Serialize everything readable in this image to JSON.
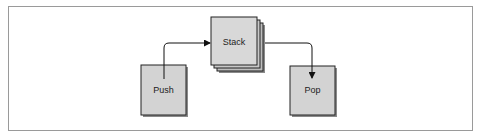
{
  "diagram": {
    "colors": {
      "box_fill": "#d3d3d3",
      "box_stroke": "#222222",
      "shadow": "#8a8a8a",
      "stack_back_fill": "#bdbdbd",
      "connector": "#111111",
      "frame_border": "#9a9a9a"
    },
    "nodes": [
      {
        "id": "push",
        "label": "Push"
      },
      {
        "id": "stack",
        "label": "Stack"
      },
      {
        "id": "pop",
        "label": "Pop"
      }
    ],
    "edges": [
      {
        "from": "push",
        "to": "stack"
      },
      {
        "from": "stack",
        "to": "pop"
      }
    ]
  }
}
